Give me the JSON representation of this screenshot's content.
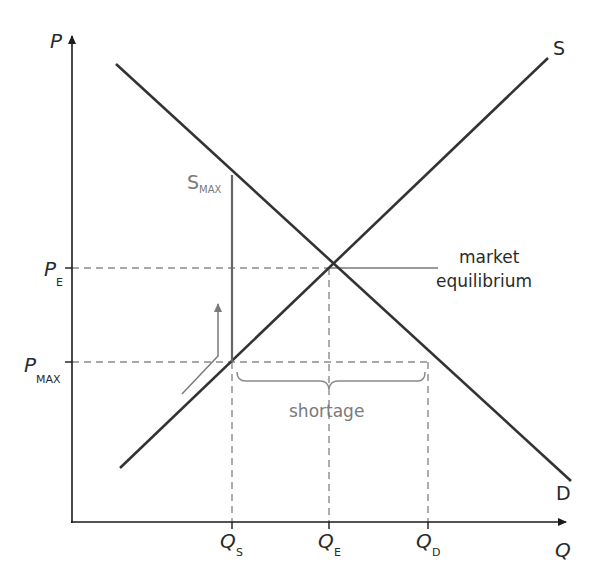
{
  "diagram": {
    "type": "supply-demand-price-ceiling",
    "axes": {
      "y_label": "P",
      "x_label": "Q"
    },
    "curves": {
      "supply_label": "S",
      "demand_label": "D"
    },
    "price_labels": {
      "equilibrium": {
        "main": "P",
        "sub": "E"
      },
      "max": {
        "main": "P",
        "sub": "MAX"
      }
    },
    "quantity_labels": {
      "supplied": {
        "main": "Q",
        "sub": "S"
      },
      "equilibrium": {
        "main": "Q",
        "sub": "E"
      },
      "demanded": {
        "main": "Q",
        "sub": "D"
      }
    },
    "annotations": {
      "smax": {
        "main": "S",
        "sub": "MAX"
      },
      "equilibrium_line1": "market",
      "equilibrium_line2": "equilibrium",
      "shortage": "shortage"
    },
    "colors": {
      "curve": "#3a3a3a",
      "guide": "#8a8a8a",
      "annotation": "#7a7a7a",
      "text": "#2a2a2a"
    }
  }
}
